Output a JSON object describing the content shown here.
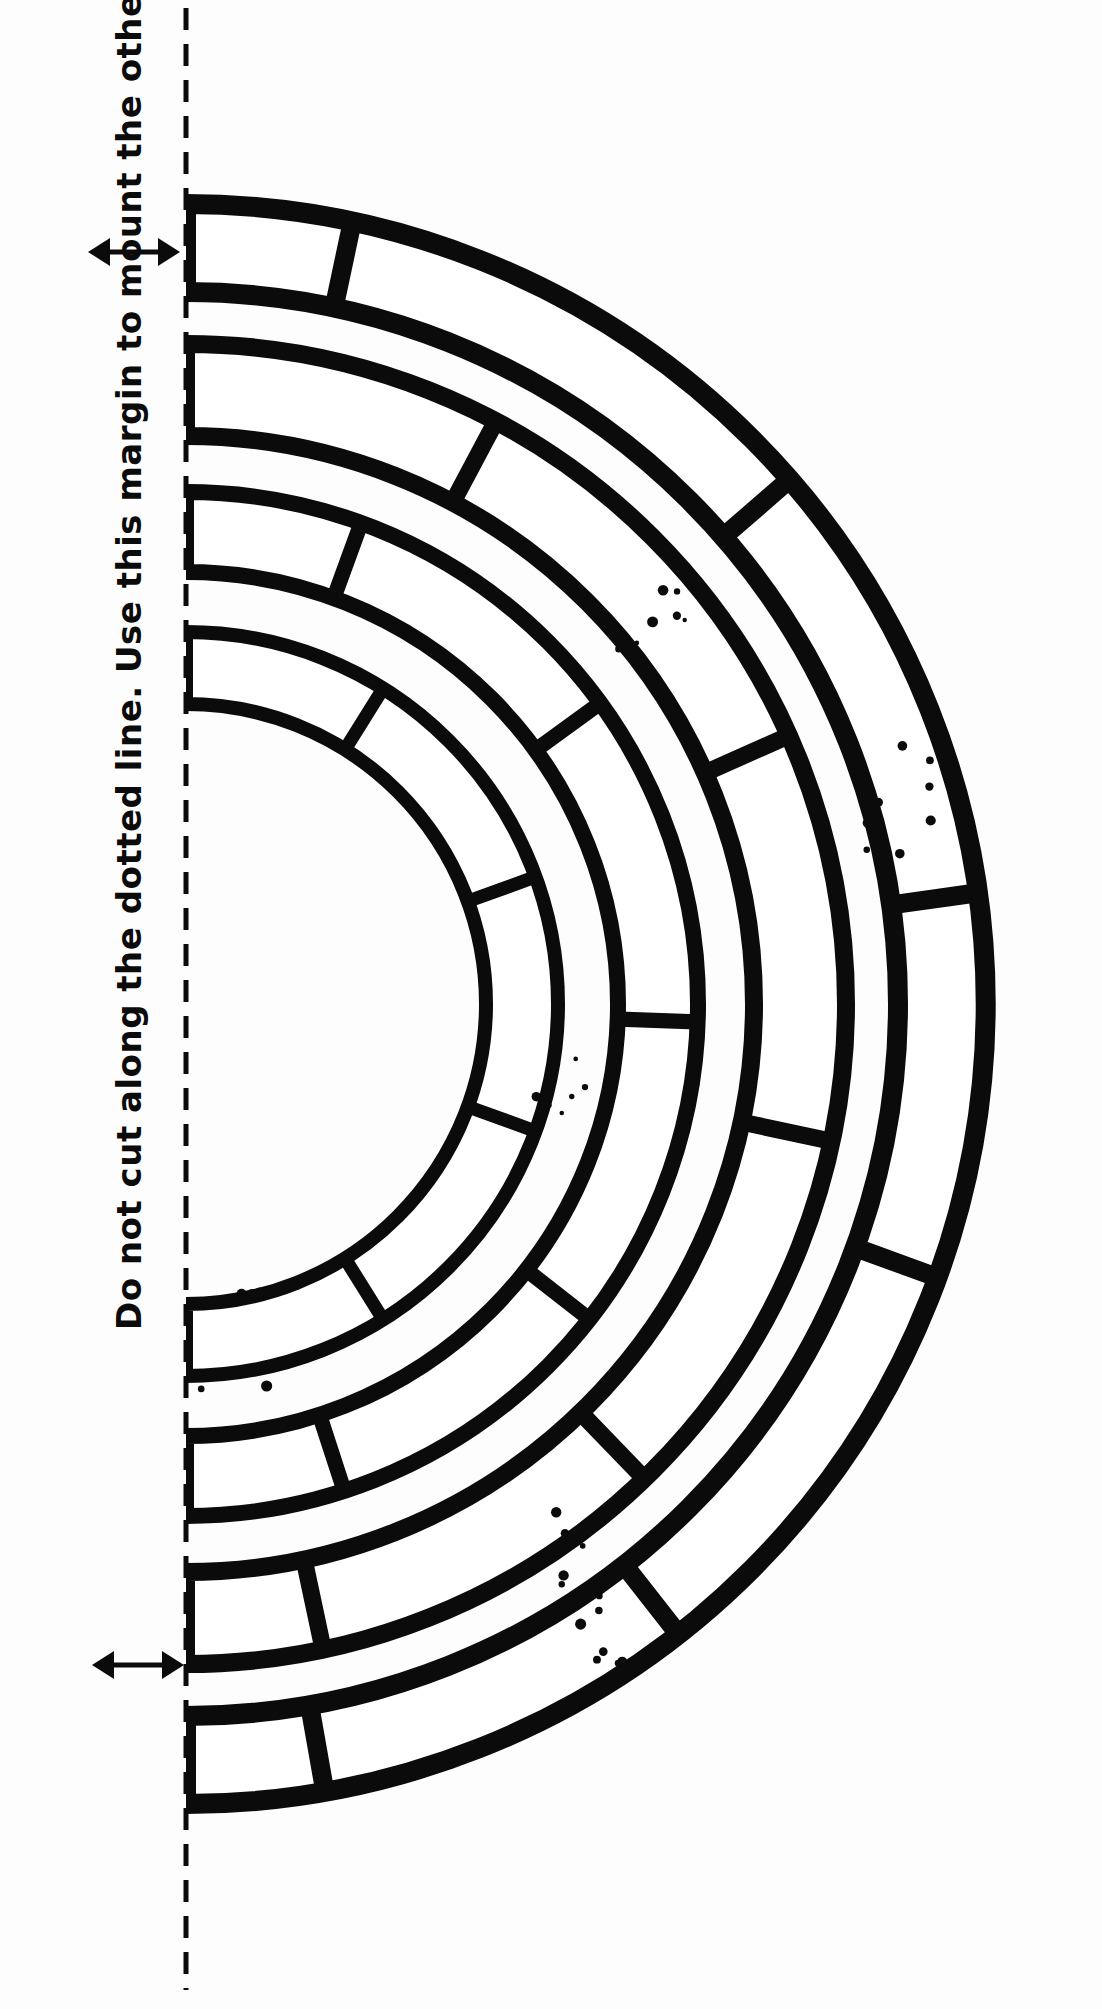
{
  "document": {
    "kind": "cut-out-pattern-sheet",
    "title": "Half ring arch voussoir template",
    "background_color": "#ffffff",
    "ink_color": "#0b0b0b",
    "width_px": 1102,
    "height_px": 2009
  },
  "instructions": {
    "margin_note": "Do not cut along the dotted line.  Use this margin to mount the other side.",
    "sentence_1": "Do not cut along the dotted line.",
    "sentence_2": "Use this margin to mount the other side.",
    "orientation": "rotated-90-ccw",
    "text_color": "#0b0b0b"
  },
  "margin_indicators": {
    "top_arrow": {
      "name": "margin-width-arrow-top",
      "glyph": "↔",
      "x": 88,
      "y": 232,
      "width": 92
    },
    "bottom_arrow": {
      "name": "margin-width-arrow-bottom",
      "glyph": "↔",
      "x": 92,
      "y": 1645,
      "width": 92
    }
  },
  "fold_line": {
    "name": "dotted-fold-line",
    "style": "dashed",
    "x": 186,
    "y_start": 8,
    "y_end": 1990,
    "dash": 22,
    "gap": 14,
    "stroke_width": 5,
    "color": "#0b0b0b"
  },
  "chart_data": {
    "type": "diagram",
    "center": {
      "x": 186,
      "y": 1004
    },
    "stroke_color": "#0b0b0b",
    "fill_color": "#ffffff",
    "rings": [
      {
        "name": "ring-outer",
        "index": 1,
        "inner_radius": 712,
        "outer_radius": 800,
        "stroke_width": 20,
        "joint_angles_deg": [
          -78,
          -41,
          -8,
          20,
          52,
          80
        ],
        "speckle_clusters": [
          {
            "cx": 905,
            "cy": 800,
            "count": 8
          },
          {
            "cx": 600,
            "cy": 1620,
            "count": 9
          }
        ]
      },
      {
        "name": "ring-second",
        "index": 2,
        "inner_radius": 568,
        "outer_radius": 660,
        "stroke_width": 18,
        "joint_angles_deg": [
          -62,
          -24,
          12,
          46,
          78
        ],
        "speckle_clusters": [
          {
            "cx": 560,
            "cy": 1555,
            "count": 6
          }
        ]
      },
      {
        "name": "ring-third",
        "index": 3,
        "inner_radius": 432,
        "outer_radius": 512,
        "stroke_width": 16,
        "joint_angles_deg": [
          -70,
          -36,
          2,
          38,
          72
        ],
        "speckle_clusters": [
          {
            "cx": 650,
            "cy": 640,
            "count": 7
          },
          {
            "cx": 555,
            "cy": 1090,
            "count": 7
          }
        ]
      },
      {
        "name": "ring-inner",
        "index": 4,
        "inner_radius": 300,
        "outer_radius": 372,
        "stroke_width": 14,
        "joint_angles_deg": [
          -58,
          -20,
          20,
          58
        ],
        "speckle_clusters": [
          {
            "cx": 230,
            "cy": 1340,
            "count": 5
          }
        ]
      }
    ],
    "arc_span_deg": {
      "start": -90,
      "end": 90
    }
  }
}
